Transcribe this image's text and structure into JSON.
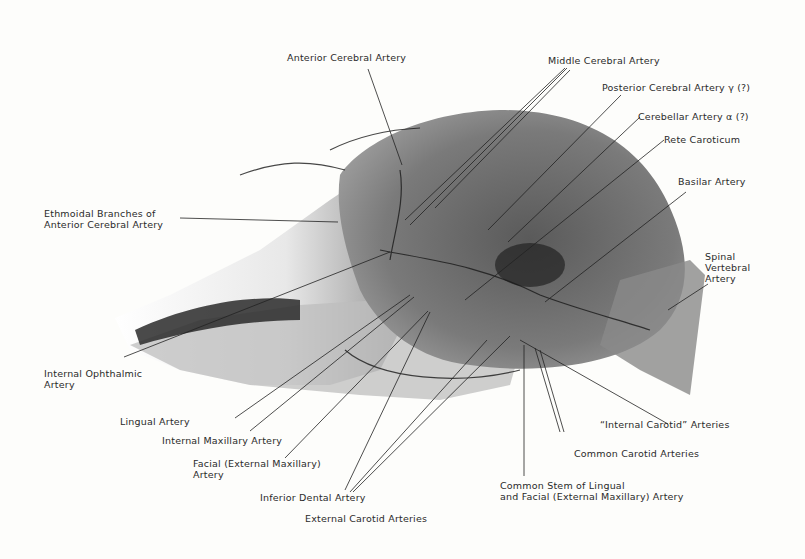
{
  "figure": {
    "labels": {
      "anterior_cerebral": "Anterior Cerebral Artery",
      "middle_cerebral": "Middle Cerebral Artery",
      "posterior_cerebral": "Posterior Cerebral Artery γ (?)",
      "cerebellar": "Cerebellar Artery α (?)",
      "rete_caroticum": "Rete Caroticum",
      "basilar": "Basilar Artery",
      "ethmoidal_1": "Ethmoidal Branches of",
      "ethmoidal_2": "Anterior Cerebral Artery",
      "spinal_1": "Spinal",
      "spinal_2": "Vertebral",
      "spinal_3": "Artery",
      "ophthalmic_1": "Internal Ophthalmic",
      "ophthalmic_2": "Artery",
      "lingual": "Lingual Artery",
      "internal_maxillary": "Internal Maxillary Artery",
      "facial_1": "Facial (External Maxillary)",
      "facial_2": "Artery",
      "inferior_dental": "Inferior Dental Artery",
      "external_carotid": "External Carotid Arteries",
      "internal_carotid": "“Internal Carotid” Arteries",
      "common_carotid": "Common Carotid Arteries",
      "common_stem_1": "Common Stem of Lingual",
      "common_stem_2": "and Facial (External Maxillary) Artery"
    }
  }
}
